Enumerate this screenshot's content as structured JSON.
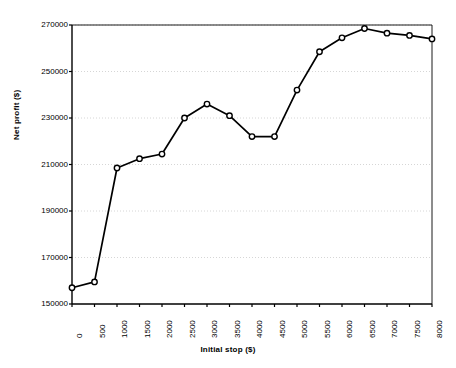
{
  "chart_data": {
    "type": "line",
    "title": "",
    "xlabel": "Initial stop ($)",
    "ylabel": "Net profit ($)",
    "x": [
      0,
      500,
      1000,
      1500,
      2000,
      2500,
      3000,
      3500,
      4000,
      4500,
      5000,
      5500,
      6000,
      6500,
      7000,
      7500,
      8000
    ],
    "values": [
      157000,
      159500,
      208500,
      212500,
      214500,
      230000,
      236000,
      231000,
      222000,
      222000,
      242000,
      258500,
      264500,
      268500,
      266500,
      265500,
      264000
    ],
    "series": [
      {
        "name": "Net profit",
        "values": [
          157000,
          159500,
          208500,
          212500,
          214500,
          230000,
          236000,
          231000,
          222000,
          222000,
          242000,
          258500,
          264500,
          268500,
          266500,
          265500,
          264000
        ]
      }
    ],
    "xtick_labels": [
      "0",
      "500",
      "1000",
      "1500",
      "2000",
      "2500",
      "3000",
      "3500",
      "4000",
      "4500",
      "5000",
      "5500",
      "6000",
      "6500",
      "7000",
      "7500",
      "8000"
    ],
    "ytick_labels": [
      "150000",
      "170000",
      "190000",
      "210000",
      "230000",
      "250000",
      "270000"
    ],
    "ytick_values": [
      150000,
      170000,
      190000,
      210000,
      230000,
      250000,
      270000
    ],
    "xlim": [
      0,
      8000
    ],
    "ylim": [
      150000,
      270000
    ],
    "grid": "horizontal-dotted",
    "legend": "none",
    "marker": "open-circle",
    "line_color": "#000000",
    "marker_fill": "#ffffff",
    "grid_color": "#cccccc",
    "axis_color": "#000000",
    "background": "#ffffff"
  }
}
